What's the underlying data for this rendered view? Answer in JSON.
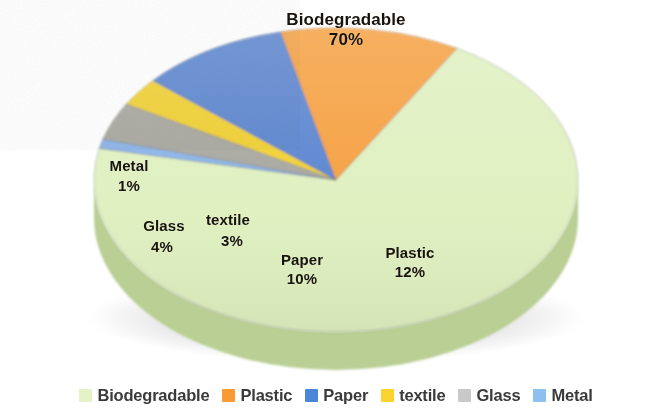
{
  "chart_data": {
    "type": "pie",
    "title": "",
    "subtitle": "",
    "xlabel": "",
    "ylabel": "",
    "three_d": true,
    "legend_position": "bottom",
    "grid": false,
    "units": "percent",
    "total": 100,
    "categories": [
      "Biodegradable",
      "Plastic",
      "Paper",
      "textile",
      "Glass",
      "Metal"
    ],
    "values": [
      70,
      12,
      10,
      3,
      4,
      1
    ],
    "slices": [
      {
        "label": "Biodegradable",
        "value": 70,
        "value_text": "70%",
        "color": "#dff0c0",
        "side_color": "#b9cf94",
        "start_angle": -60,
        "end_angle": 192
      },
      {
        "label": "Plastic",
        "value": 12,
        "value_text": "12%",
        "color": "#f5a143",
        "side_color": "#96561c",
        "start_angle": -60,
        "end_angle": -103.2
      },
      {
        "label": "Paper",
        "value": 10,
        "value_text": "10%",
        "color": "#5b86d0",
        "side_color": "#33477f",
        "start_angle": -103.2,
        "end_angle": -139.2
      },
      {
        "label": "textile",
        "value": 3,
        "value_text": "3%",
        "color": "#f2d133",
        "side_color": "#8a7318",
        "start_angle": -139.2,
        "end_angle": -150.0
      },
      {
        "label": "Glass",
        "value": 4,
        "value_text": "4%",
        "color": "#a8a8a0",
        "side_color": "#6d6d66",
        "start_angle": -150.0,
        "end_angle": -164.4
      },
      {
        "label": "Metal",
        "value": 1,
        "value_text": "1%",
        "color": "#8ab4e8",
        "side_color": "#4d6f9e",
        "start_angle": -164.4,
        "end_angle": -168.0
      }
    ]
  },
  "labels": {
    "biodegradable": {
      "name": "Biodegradable",
      "percent": "70%"
    },
    "plastic": {
      "name": "Plastic",
      "percent": "12%"
    },
    "paper": {
      "name": "Paper",
      "percent": "10%"
    },
    "textile": {
      "name": "textile",
      "percent": "3%"
    },
    "glass": {
      "name": "Glass",
      "percent": "4%"
    },
    "metal": {
      "name": "Metal",
      "percent": "1%"
    }
  },
  "legend": {
    "items": [
      {
        "label": "Biodegradable",
        "color": "#e4f2c6"
      },
      {
        "label": "Plastic",
        "color": "#f79b32"
      },
      {
        "label": "Paper",
        "color": "#4a86d8"
      },
      {
        "label": "textile",
        "color": "#fbd22e"
      },
      {
        "label": "Glass",
        "color": "#c9c9c9"
      },
      {
        "label": "Metal",
        "color": "#8dc0f0"
      }
    ]
  }
}
